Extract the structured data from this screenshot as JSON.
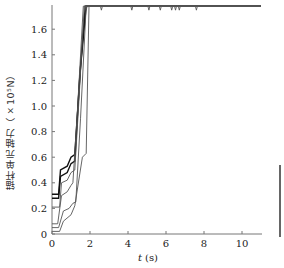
{
  "chart_data": {
    "type": "line",
    "title": "",
    "xlabel": "t (s)",
    "ylabel": "锚杆单元轴力（×10⁵N）",
    "xlim": [
      0,
      11
    ],
    "ylim": [
      0,
      1.78
    ],
    "xticks": [
      0,
      2,
      4,
      6,
      8,
      10
    ],
    "yticks": [
      0,
      0.2,
      0.4,
      0.6,
      0.8,
      1.0,
      1.2,
      1.4,
      1.6
    ],
    "ytick_labels": [
      "0",
      "0.2",
      "0.4",
      "0.6",
      "0.8",
      "1.0",
      "1.2",
      "1.4",
      "1.6"
    ],
    "grid": false,
    "legend": null,
    "series": [
      {
        "name": "bolt-1",
        "x": [
          0,
          0.35,
          0.45,
          0.8,
          1.0,
          1.2,
          1.5,
          1.8,
          11
        ],
        "y": [
          0.31,
          0.31,
          0.5,
          0.53,
          0.6,
          0.62,
          1.3,
          1.78,
          1.78
        ]
      },
      {
        "name": "bolt-2",
        "x": [
          0,
          0.35,
          0.45,
          0.8,
          1.0,
          1.2,
          1.45,
          1.75,
          11
        ],
        "y": [
          0.28,
          0.28,
          0.45,
          0.48,
          0.55,
          0.57,
          1.2,
          1.78,
          1.78
        ]
      },
      {
        "name": "bolt-3",
        "x": [
          0,
          0.4,
          0.5,
          0.8,
          1.0,
          1.2,
          1.4,
          1.7,
          11
        ],
        "y": [
          0.21,
          0.21,
          0.4,
          0.42,
          0.48,
          0.5,
          1.0,
          1.78,
          1.78
        ]
      },
      {
        "name": "bolt-4",
        "x": [
          0,
          0.3,
          0.5,
          0.8,
          1.0,
          1.1,
          1.35,
          1.65,
          11
        ],
        "y": [
          0.08,
          0.08,
          0.3,
          0.33,
          0.38,
          0.4,
          1.0,
          1.78,
          1.78
        ]
      },
      {
        "name": "bolt-5",
        "x": [
          0,
          0.35,
          0.6,
          0.9,
          1.1,
          1.25,
          1.5,
          1.8,
          11
        ],
        "y": [
          0.05,
          0.05,
          0.18,
          0.2,
          0.24,
          0.25,
          0.9,
          1.78,
          1.78
        ]
      },
      {
        "name": "bolt-6",
        "x": [
          0,
          0.4,
          0.6,
          1.0,
          1.2,
          1.6,
          1.8,
          1.95,
          11
        ],
        "y": [
          0.02,
          0.02,
          0.1,
          0.15,
          0.22,
          0.6,
          0.63,
          1.78,
          1.78
        ]
      }
    ],
    "annotations": [
      "Curves saturate near 1.78 with small dips between t≈1.5 and t≈7.7"
    ]
  },
  "axis": {
    "x_title_italic": "t",
    "x_title_unit": "(s)",
    "x_tick_labels": [
      "0",
      "2",
      "4",
      "6",
      "8",
      "10"
    ],
    "y_tick_labels": [
      "0",
      "0.2",
      "0.4",
      "0.6",
      "0.8",
      "1.0",
      "1.2",
      "1.4",
      "1.6"
    ],
    "y_title": "锚杆单元轴力（×10⁵N）"
  },
  "colors": {
    "line_dark": "#111111",
    "line_mid": "#555555",
    "axis": "#777777"
  }
}
